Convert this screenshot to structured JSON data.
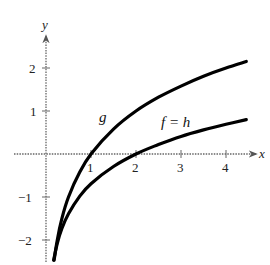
{
  "chart_data": {
    "type": "line",
    "title": "",
    "xlabel": "x",
    "ylabel": "y",
    "xlim": [
      -0.5,
      4.95
    ],
    "ylim": [
      -2.5,
      2.75
    ],
    "grid": false,
    "x_ticks": [
      1,
      2,
      3,
      4
    ],
    "y_ticks": [
      -2,
      -1,
      1,
      2
    ],
    "x_tick_labels": [
      "1",
      "2",
      "3",
      "4"
    ],
    "y_tick_labels": [
      "−2",
      "−1",
      "1",
      "2"
    ],
    "series": [
      {
        "name": "g",
        "label": "g",
        "x": [
          0.18,
          0.25,
          0.35,
          0.5,
          0.75,
          1.0,
          1.5,
          2.0,
          2.5,
          3.0,
          3.5,
          4.0,
          4.45
        ],
        "y": [
          -2.47,
          -2.0,
          -1.51,
          -1.0,
          -0.42,
          0.0,
          0.58,
          1.0,
          1.32,
          1.58,
          1.81,
          2.0,
          2.15
        ]
      },
      {
        "name": "f = h",
        "label": "f = h",
        "x": [
          0.17,
          0.25,
          0.35,
          0.5,
          0.75,
          1.0,
          1.5,
          2.0,
          2.5,
          3.0,
          3.5,
          4.0,
          4.45
        ],
        "y": [
          -2.47,
          -2.08,
          -1.74,
          -1.39,
          -0.98,
          -0.69,
          -0.29,
          0.0,
          0.22,
          0.41,
          0.56,
          0.69,
          0.8
        ]
      }
    ],
    "annotations": [
      {
        "text": "g",
        "x": 1.3,
        "y": 0.95
      },
      {
        "text": "f = h",
        "x": 2.7,
        "y": 0.65
      }
    ]
  },
  "labels": {
    "x_axis": "x",
    "y_axis": "y",
    "g_label": "g",
    "fh_label": "f = h",
    "xt1": "1",
    "xt2": "2",
    "xt3": "3",
    "xt4": "4",
    "yt2": "2",
    "yt1": "1",
    "ytm1": "−1",
    "ytm2": "−2"
  }
}
